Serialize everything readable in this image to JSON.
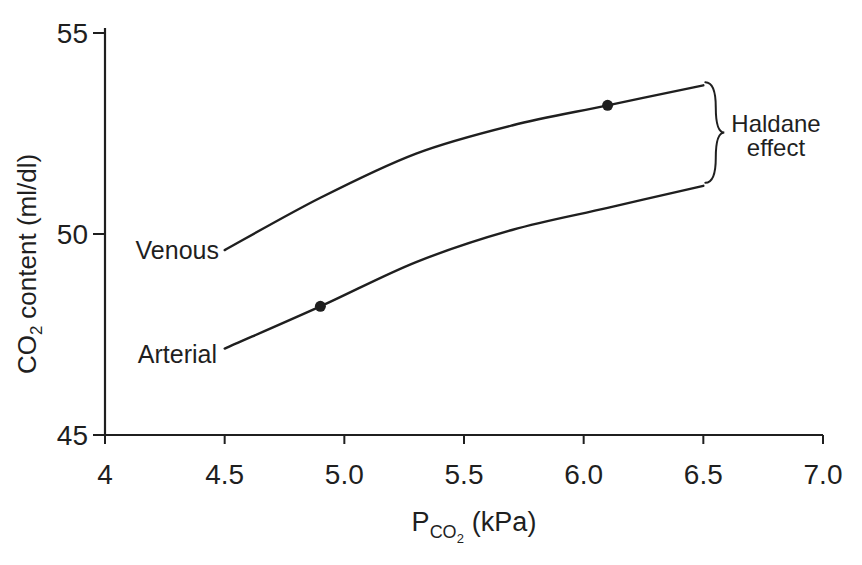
{
  "figure": {
    "background": "#ffffff",
    "ink_color": "#1f1f1f"
  },
  "chart_data": {
    "type": "line",
    "title": "",
    "xlabel": "PCO2 (kPa)",
    "xlabel_parts": {
      "main": "P",
      "sub": "CO",
      "subsub": "2",
      "rest": "(kPa)"
    },
    "ylabel": "CO2 content (ml/dl)",
    "ylabel_parts": {
      "main": "CO",
      "sub": "2",
      "rest": "content (ml/dl)"
    },
    "xlim": [
      4,
      7
    ],
    "ylim": [
      45,
      55
    ],
    "grid": false,
    "legend_position": "none",
    "x_ticks": [
      {
        "value": 4,
        "label": "4"
      },
      {
        "value": 4.5,
        "label": "4.5"
      },
      {
        "value": 5,
        "label": "5.0"
      },
      {
        "value": 5.5,
        "label": "5.5"
      },
      {
        "value": 6,
        "label": "6.0"
      },
      {
        "value": 6.5,
        "label": "6.5"
      },
      {
        "value": 7,
        "label": "7.0"
      }
    ],
    "y_ticks": [
      {
        "value": 55,
        "label": "55"
      },
      {
        "value": 50,
        "label": "50"
      },
      {
        "value": 45,
        "label": "45"
      }
    ],
    "series": [
      {
        "name": "venous",
        "label": "Venous",
        "color": "#1f1f1f",
        "x": [
          4.5,
          4.9,
          5.3,
          5.7,
          6.1,
          6.5
        ],
        "y": [
          49.6,
          50.9,
          52.0,
          52.7,
          53.2,
          53.7
        ],
        "marker": {
          "x": 6.1,
          "y": 53.2
        }
      },
      {
        "name": "arterial",
        "label": "Arterial",
        "color": "#1f1f1f",
        "x": [
          4.5,
          4.9,
          5.3,
          5.7,
          6.1,
          6.5
        ],
        "y": [
          47.15,
          48.2,
          49.3,
          50.1,
          50.65,
          51.2
        ],
        "marker": {
          "x": 4.9,
          "y": 48.2
        }
      }
    ],
    "annotation": {
      "lines": [
        "Haldane",
        "effect"
      ],
      "brace_x": 6.5,
      "y_top": 53.7,
      "y_bottom": 51.2
    }
  }
}
